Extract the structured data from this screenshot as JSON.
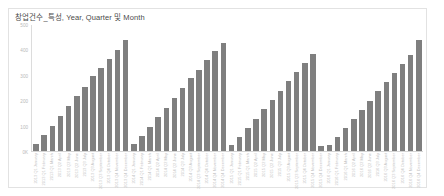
{
  "card": {
    "title": "창업건수_특성, Year, Quarter 및 Month"
  },
  "chart_data": {
    "type": "bar",
    "title": "창업건수_특성, Year, Quarter 및 Month",
    "xlabel": "",
    "ylabel": "",
    "ylim": [
      0,
      500
    ],
    "grid": false,
    "legend": "none",
    "bar_color": "#7f7f7f",
    "axis_color": "#dcdcdc",
    "yticks": [
      0,
      100,
      200,
      300,
      400,
      500
    ],
    "ytick_labels": [
      "0K",
      "100",
      "200",
      "300",
      "400",
      "500"
    ],
    "groups": [
      "2013",
      "2014",
      "2015",
      "2016"
    ],
    "categories": [
      "2013 Q1 January",
      "2013 Q1 February",
      "2013 Q1 March",
      "2013 Q2 April",
      "2013 Q2 May",
      "2013 Q2 June",
      "2013 Q3 July",
      "2013 Q3 August",
      "2013 Q3 September",
      "2013 Q4 October",
      "2013 Q4 November",
      "2013 Q4 December",
      "2014 Q1 January",
      "2014 Q1 February",
      "2014 Q1 March",
      "2014 Q2 April",
      "2014 Q2 May",
      "2014 Q2 June",
      "2014 Q3 July",
      "2014 Q3 August",
      "2014 Q3 September",
      "2014 Q4 October",
      "2014 Q4 November",
      "2014 Q4 December",
      "2015 Q1 January",
      "2015 Q1 February",
      "2015 Q1 March",
      "2015 Q2 April",
      "2015 Q2 May",
      "2015 Q2 June",
      "2015 Q3 July",
      "2015 Q3 August",
      "2015 Q3 September",
      "2015 Q4 October",
      "2015 Q4 November",
      "2015 Q4 December",
      "2016 Q1 January",
      "2016 Q1 February",
      "2016 Q1 March",
      "2016 Q2 April",
      "2016 Q2 May",
      "2016 Q2 June",
      "2016 Q3 July",
      "2016 Q3 August",
      "2016 Q3 September",
      "2016 Q4 October",
      "2016 Q4 November",
      "2016 Q4 December"
    ],
    "tick_labels": [
      "2013 Q1 January",
      "2013 Q1 February",
      "2013 Q1 March",
      "2013 Q2 April",
      "2013 Q2 May",
      "2013 Q2 June",
      "2013 Q3 July",
      "2013 Q3 August",
      "2013 Q3 September",
      "2013 Q4 October",
      "2013 Q4 November",
      "2013 Q4 December",
      "2014 Q1 January",
      "2014 Q1 February",
      "2014 Q1 March",
      "2014 Q2 April",
      "2014 Q2 May",
      "2014 Q2 June",
      "2014 Q3 July",
      "2014 Q3 August",
      "2014 Q3 September",
      "2014 Q4 October",
      "2014 Q4 November",
      "2014 Q4 December",
      "2015 Q1 January",
      "2015 Q1 February",
      "2015 Q1 March",
      "2015 Q2 April",
      "2015 Q2 May",
      "2015 Q2 June",
      "2015 Q3 July",
      "2015 Q3 August",
      "2015 Q3 September",
      "2015 Q4 October",
      "2015 Q4 November",
      "2015 Q4 December",
      "2016 Q1 January",
      "2016 Q1 February",
      "2016 Q1 March",
      "2016 Q2 April",
      "2016 Q2 May",
      "2016 Q2 June",
      "2016 Q3 July",
      "2016 Q3 August",
      "2016 Q3 September",
      "2016 Q4 October",
      "2016 Q4 November",
      "2016 Q4 December"
    ],
    "values": [
      28,
      62,
      100,
      140,
      180,
      218,
      256,
      296,
      330,
      366,
      400,
      440,
      26,
      58,
      96,
      134,
      172,
      212,
      250,
      288,
      322,
      360,
      398,
      430,
      24,
      56,
      92,
      128,
      166,
      204,
      240,
      276,
      312,
      348,
      384,
      20,
      22,
      54,
      90,
      126,
      162,
      200,
      238,
      274,
      310,
      346,
      382,
      442
    ]
  }
}
